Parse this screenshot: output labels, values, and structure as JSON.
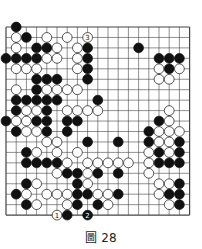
{
  "diagram": {
    "type": "go-board",
    "size": 19,
    "caption": "圖 28",
    "colors": {
      "grid": "#444444",
      "black": "#111111",
      "white": "#ffffff",
      "edge": "#333333"
    },
    "black": [
      [
        1,
        0
      ],
      [
        2,
        1
      ],
      [
        3,
        2
      ],
      [
        4,
        2
      ],
      [
        8,
        2
      ],
      [
        13,
        2
      ],
      [
        0,
        3
      ],
      [
        1,
        3
      ],
      [
        2,
        3
      ],
      [
        3,
        3
      ],
      [
        8,
        3
      ],
      [
        15,
        3
      ],
      [
        16,
        3
      ],
      [
        17,
        3
      ],
      [
        8,
        4
      ],
      [
        16,
        4
      ],
      [
        3,
        5
      ],
      [
        4,
        5
      ],
      [
        5,
        5
      ],
      [
        8,
        5
      ],
      [
        3,
        6
      ],
      [
        1,
        7
      ],
      [
        2,
        7
      ],
      [
        3,
        7
      ],
      [
        4,
        7
      ],
      [
        5,
        7
      ],
      [
        9,
        7
      ],
      [
        1,
        8
      ],
      [
        4,
        8
      ],
      [
        0,
        9
      ],
      [
        3,
        9
      ],
      [
        4,
        9
      ],
      [
        6,
        9
      ],
      [
        7,
        9
      ],
      [
        15,
        9
      ],
      [
        1,
        10
      ],
      [
        4,
        10
      ],
      [
        6,
        10
      ],
      [
        14,
        10
      ],
      [
        8,
        11
      ],
      [
        11,
        11
      ],
      [
        14,
        11
      ],
      [
        17,
        11
      ],
      [
        2,
        12
      ],
      [
        15,
        12
      ],
      [
        17,
        12
      ],
      [
        2,
        13
      ],
      [
        3,
        13
      ],
      [
        4,
        13
      ],
      [
        5,
        13
      ],
      [
        15,
        13
      ],
      [
        16,
        13
      ],
      [
        17,
        13
      ],
      [
        6,
        14
      ],
      [
        7,
        14
      ],
      [
        9,
        14
      ],
      [
        11,
        14
      ],
      [
        2,
        15
      ],
      [
        7,
        15
      ],
      [
        17,
        15
      ],
      [
        1,
        16
      ],
      [
        7,
        16
      ],
      [
        8,
        16
      ],
      [
        11,
        16
      ],
      [
        16,
        16
      ],
      [
        17,
        16
      ],
      [
        2,
        17
      ],
      [
        7,
        17
      ],
      [
        9,
        17
      ],
      [
        17,
        17
      ],
      [
        6,
        18
      ]
    ],
    "white": [
      [
        1,
        1
      ],
      [
        4,
        1
      ],
      [
        6,
        1
      ],
      [
        1,
        2
      ],
      [
        5,
        2
      ],
      [
        7,
        2
      ],
      [
        4,
        3
      ],
      [
        5,
        3
      ],
      [
        7,
        3
      ],
      [
        1,
        4
      ],
      [
        2,
        4
      ],
      [
        3,
        4
      ],
      [
        7,
        4
      ],
      [
        15,
        4
      ],
      [
        17,
        4
      ],
      [
        15,
        5
      ],
      [
        16,
        5
      ],
      [
        1,
        6
      ],
      [
        4,
        6
      ],
      [
        5,
        6
      ],
      [
        6,
        6
      ],
      [
        7,
        6
      ],
      [
        2,
        8
      ],
      [
        3,
        8
      ],
      [
        6,
        8
      ],
      [
        7,
        8
      ],
      [
        8,
        8
      ],
      [
        9,
        8
      ],
      [
        16,
        8
      ],
      [
        1,
        9
      ],
      [
        2,
        9
      ],
      [
        16,
        9
      ],
      [
        2,
        10
      ],
      [
        3,
        10
      ],
      [
        15,
        10
      ],
      [
        16,
        10
      ],
      [
        17,
        10
      ],
      [
        4,
        11
      ],
      [
        5,
        11
      ],
      [
        15,
        11
      ],
      [
        16,
        11
      ],
      [
        3,
        12
      ],
      [
        5,
        12
      ],
      [
        7,
        12
      ],
      [
        14,
        12
      ],
      [
        16,
        12
      ],
      [
        6,
        13
      ],
      [
        8,
        13
      ],
      [
        9,
        13
      ],
      [
        10,
        13
      ],
      [
        11,
        13
      ],
      [
        12,
        13
      ],
      [
        14,
        13
      ],
      [
        5,
        14
      ],
      [
        8,
        14
      ],
      [
        14,
        14
      ],
      [
        3,
        15
      ],
      [
        8,
        15
      ],
      [
        15,
        15
      ],
      [
        16,
        15
      ],
      [
        2,
        16
      ],
      [
        4,
        16
      ],
      [
        5,
        16
      ],
      [
        6,
        16
      ],
      [
        9,
        16
      ],
      [
        10,
        16
      ],
      [
        15,
        16
      ],
      [
        3,
        17
      ],
      [
        6,
        17
      ],
      [
        10,
        17
      ],
      [
        16,
        17
      ]
    ],
    "numbered": [
      {
        "label": "1",
        "color": "white",
        "x": 5,
        "y": 18
      },
      {
        "label": "2",
        "color": "black",
        "x": 8,
        "y": 18
      },
      {
        "label": "3",
        "color": "white",
        "x": 8,
        "y": 1
      }
    ]
  }
}
